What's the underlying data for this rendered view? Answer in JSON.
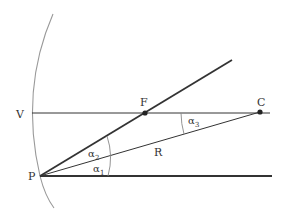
{
  "diagram": {
    "labels": {
      "V": "V",
      "F": "F",
      "C": "C",
      "P": "P",
      "R": "R",
      "alpha1": "α",
      "alpha1_sub": "1",
      "alpha2": "α",
      "alpha2_sub": "2",
      "alpha3": "α",
      "alpha3_sub": "3"
    },
    "colors": {
      "line": "#333333",
      "mirror": "#999999",
      "background": "#ffffff"
    },
    "points": {
      "P": [
        40,
        176
      ],
      "F": [
        145,
        113
      ],
      "C": [
        260,
        112
      ]
    }
  }
}
